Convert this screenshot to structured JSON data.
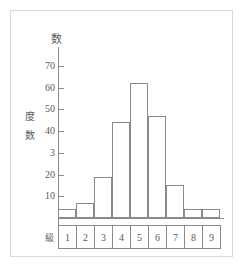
{
  "chart_data": {
    "type": "bar",
    "title": "",
    "subtitle": "",
    "xlabel": "級",
    "ylabel": "度数",
    "y_axis_top_label": "数",
    "categories": [
      "1",
      "2",
      "3",
      "4",
      "5",
      "6",
      "7",
      "8",
      "9"
    ],
    "values": [
      4,
      7,
      19,
      44,
      62,
      47,
      15,
      4,
      4
    ],
    "ylim": [
      0,
      75
    ],
    "ytick_labels": [
      "70",
      "60",
      "50",
      "40",
      "3",
      "20",
      "10"
    ],
    "ytick_values": [
      70,
      60,
      50,
      40,
      30,
      20,
      10
    ],
    "grid": false,
    "legend": null,
    "bar_style": "outlined",
    "colors": {
      "axis": "#8a8a8a",
      "bar_outline": "#8a8a8a",
      "bar_fill": "transparent",
      "text": "#5a5a5a",
      "page_border": "#d9d9d9",
      "background": "#ffffff"
    }
  }
}
